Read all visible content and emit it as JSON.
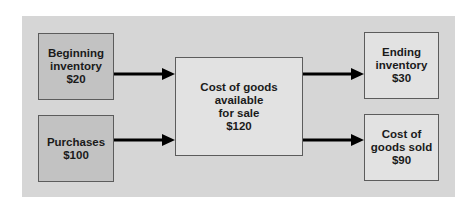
{
  "diagram": {
    "colors": {
      "panel": "#d6d6d6",
      "input_box": "#c2c2c2",
      "output_box": "#e2e2e2",
      "border": "#5c5c5c",
      "arrow": "#000000",
      "text": "#1a1a1a"
    },
    "nodes": {
      "beginning_inventory": {
        "line1": "Beginning",
        "line2": "inventory",
        "line3": "$20"
      },
      "purchases": {
        "line1": "Purchases",
        "line2": "$100"
      },
      "available": {
        "line1": "Cost of goods",
        "line2": "available",
        "line3": "for sale",
        "line4": "$120"
      },
      "ending_inventory": {
        "line1": "Ending",
        "line2": "inventory",
        "line3": "$30"
      },
      "cogs": {
        "line1": "Cost of",
        "line2": "goods sold",
        "line3": "$90"
      }
    },
    "edges": [
      {
        "from": "beginning_inventory",
        "to": "available"
      },
      {
        "from": "purchases",
        "to": "available"
      },
      {
        "from": "available",
        "to": "ending_inventory"
      },
      {
        "from": "available",
        "to": "cogs"
      }
    ]
  }
}
